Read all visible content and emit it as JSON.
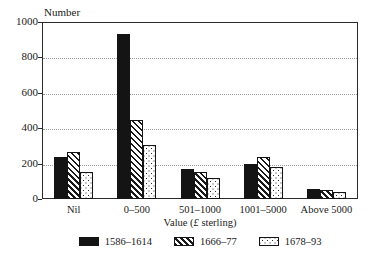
{
  "chart_data": {
    "type": "bar",
    "title": "",
    "ylabel": "Number",
    "xlabel": "Value (£ sterling)",
    "xlabel_parts": {
      "prefix": "Value (",
      "pound": "£",
      "suffix": " sterling)"
    },
    "categories": [
      "Nil",
      "0–500",
      "501–1000",
      "1001–5000",
      "Above 5000"
    ],
    "series": [
      {
        "name": "1586–1614",
        "pattern": "solid-black",
        "values": [
          240,
          930,
          172,
          200,
          55
        ]
      },
      {
        "name": "1666–77",
        "pattern": "diagonal-hatch",
        "values": [
          265,
          445,
          150,
          235,
          52
        ]
      },
      {
        "name": "1678–93",
        "pattern": "dotted",
        "values": [
          155,
          305,
          117,
          180,
          40
        ]
      }
    ],
    "ylim": [
      0,
      1000
    ],
    "yticks": [
      0,
      200,
      400,
      600,
      800,
      1000
    ],
    "ytick_labels": [
      "0",
      "200",
      "400",
      "600",
      "800",
      "1000"
    ],
    "grid": true,
    "grid_axis": "y",
    "legend_position": "bottom",
    "colors": {
      "ink": "#141414",
      "gridline": "#9a9a9a",
      "background": "#ffffff"
    }
  }
}
